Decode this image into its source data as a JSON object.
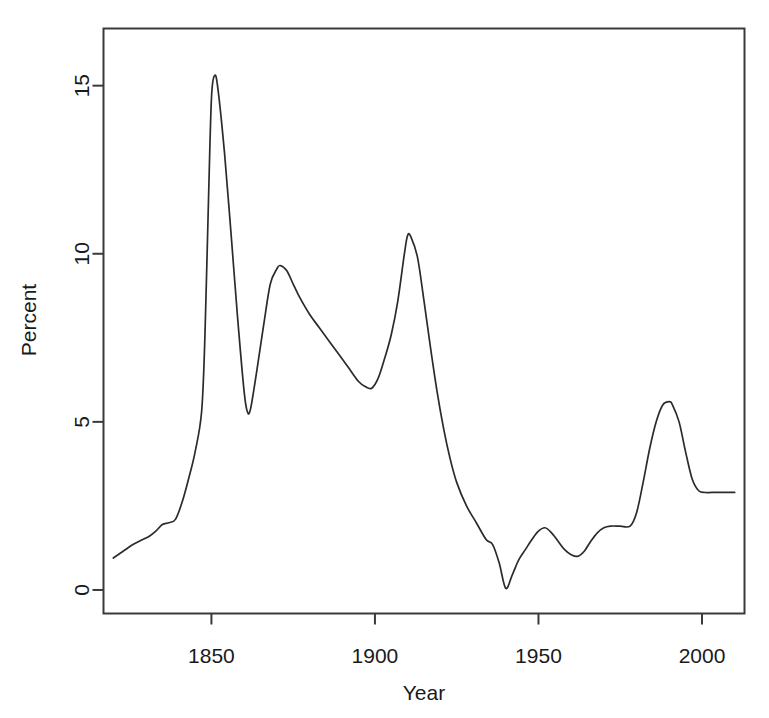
{
  "chart_data": {
    "type": "line",
    "title": "",
    "subtitle": "",
    "xlabel": "Year",
    "ylabel": "Percent",
    "xlim": [
      1817,
      2013
    ],
    "ylim": [
      -0.7,
      16.7
    ],
    "xticks": [
      1850,
      1900,
      1950,
      2000
    ],
    "xtick_labels": [
      "1850",
      "1900",
      "1950",
      "2000"
    ],
    "yticks": [
      0,
      5,
      10,
      15
    ],
    "ytick_labels": [
      "0",
      "5",
      "10",
      "15"
    ],
    "grid": false,
    "legend": null,
    "legend_position": "none",
    "line_color": "#2b2b2b",
    "axis_color": "#3a3a3a",
    "background_color": "#ffffff",
    "series": [
      {
        "name": "Percent",
        "x": [
          1820,
          1823,
          1826,
          1829,
          1831,
          1833,
          1835,
          1837,
          1839,
          1841,
          1843,
          1845,
          1847,
          1848,
          1849,
          1850,
          1851,
          1852,
          1854,
          1856,
          1858,
          1860,
          1861,
          1862,
          1864,
          1866,
          1868,
          1870,
          1871,
          1873,
          1875,
          1877,
          1880,
          1883,
          1886,
          1889,
          1892,
          1895,
          1897,
          1899,
          1901,
          1903,
          1905,
          1907,
          1909,
          1910,
          1911,
          1913,
          1915,
          1917,
          1919,
          1921,
          1923,
          1925,
          1928,
          1931,
          1934,
          1936,
          1938,
          1940,
          1942,
          1944,
          1946,
          1948,
          1950,
          1952,
          1954,
          1956,
          1958,
          1960,
          1962,
          1964,
          1966,
          1968,
          1970,
          1972,
          1975,
          1978,
          1980,
          1982,
          1984,
          1986,
          1988,
          1990,
          1991,
          1993,
          1995,
          1997,
          1999,
          2001,
          2003,
          2006,
          2010
        ],
        "y": [
          0.95,
          1.15,
          1.35,
          1.5,
          1.6,
          1.75,
          1.95,
          2.0,
          2.1,
          2.6,
          3.3,
          4.1,
          5.3,
          7.5,
          11.2,
          14.6,
          15.3,
          14.9,
          13.0,
          10.6,
          8.1,
          5.9,
          5.3,
          5.4,
          6.6,
          7.9,
          9.1,
          9.55,
          9.65,
          9.5,
          9.1,
          8.7,
          8.2,
          7.8,
          7.4,
          7.0,
          6.6,
          6.2,
          6.05,
          6.0,
          6.3,
          6.9,
          7.6,
          8.6,
          10.0,
          10.55,
          10.5,
          9.9,
          8.6,
          7.2,
          5.9,
          4.8,
          3.9,
          3.2,
          2.5,
          2.0,
          1.5,
          1.35,
          0.8,
          0.05,
          0.45,
          0.9,
          1.2,
          1.5,
          1.75,
          1.85,
          1.7,
          1.45,
          1.2,
          1.05,
          1.0,
          1.15,
          1.45,
          1.7,
          1.85,
          1.9,
          1.9,
          1.9,
          2.3,
          3.2,
          4.2,
          5.0,
          5.5,
          5.6,
          5.5,
          5.0,
          4.1,
          3.3,
          2.95,
          2.9,
          2.9,
          2.9,
          2.9
        ]
      }
    ]
  },
  "axes": {
    "ylabel": "Percent",
    "xlabel": "Year"
  }
}
